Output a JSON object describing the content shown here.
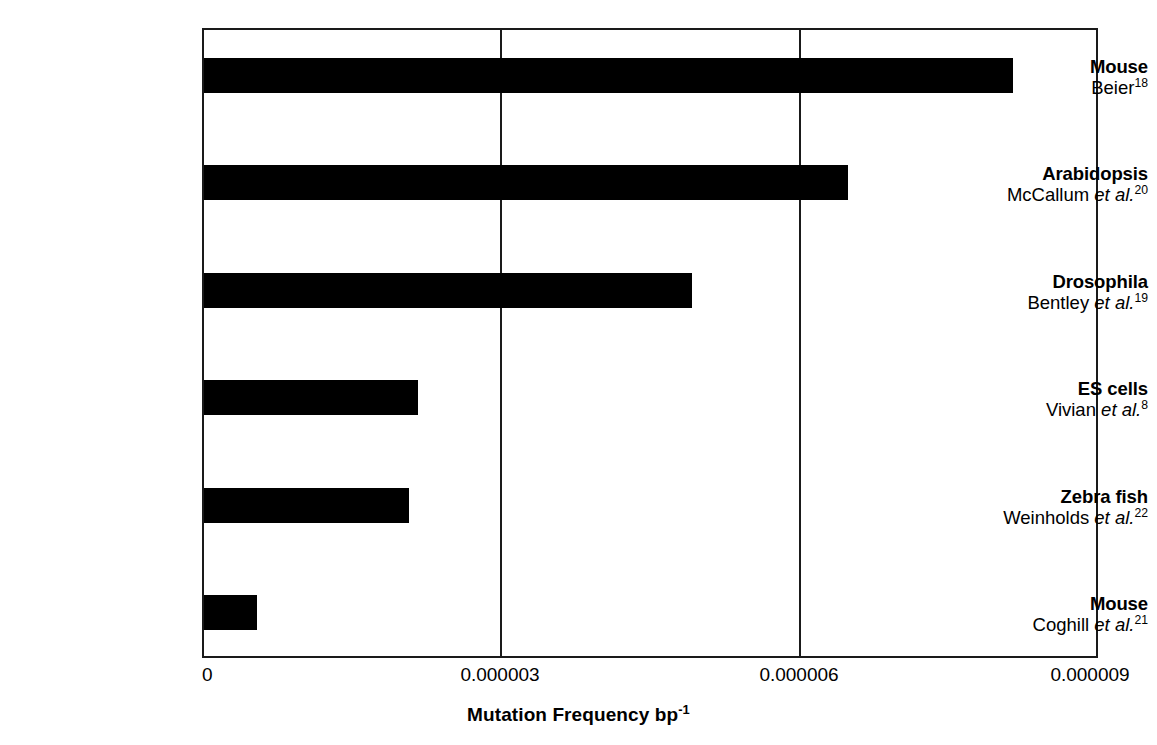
{
  "chart_data": {
    "type": "bar",
    "orientation": "horizontal",
    "title": "",
    "xlabel": "Mutation Frequency bp-1",
    "xlabel_rich": {
      "text": "Mutation Frequency bp",
      "superscript": "-1"
    },
    "ylabel": "",
    "xlim": [
      0,
      9e-06
    ],
    "xticks": [
      0,
      3e-06,
      6e-06,
      9e-06
    ],
    "xtick_labels": [
      "0",
      "0.000003",
      "0.000006",
      "0.000009"
    ],
    "grid": "vertical gridlines at 0.000003 and 0.000006",
    "legend": "none",
    "bar_color": "#000000",
    "categories": [
      "Mouse Beier18",
      "Arabidopsis McCallum et al.20",
      "Drosophila Bentley et al.19",
      "ES cells Vivian et al.8",
      "Zebra fish Weinholds et al.22",
      "Mouse Coghill et al.21"
    ],
    "values": [
      8.16e-06,
      6.5e-06,
      4.92e-06,
      2.16e-06,
      2.07e-06,
      5.3e-07
    ],
    "bars": [
      {
        "organism": "Mouse",
        "reference_author": "Beier",
        "reference_etal": "",
        "reference_superscript": "18",
        "value": 8.16e-06
      },
      {
        "organism": "Arabidopsis",
        "reference_author": "McCallum",
        "reference_etal": "et al.",
        "reference_superscript": "20",
        "value": 6.5e-06
      },
      {
        "organism": "Drosophila",
        "reference_author": "Bentley",
        "reference_etal": "et al.",
        "reference_superscript": "19",
        "value": 4.92e-06
      },
      {
        "organism": "ES cells",
        "reference_author": "Vivian",
        "reference_etal": "et al.",
        "reference_superscript": "8",
        "value": 2.16e-06
      },
      {
        "organism": "Zebra fish",
        "reference_author": "Weinholds",
        "reference_etal": "et al.",
        "reference_superscript": "22",
        "value": 2.07e-06
      },
      {
        "organism": "Mouse",
        "reference_author": "Coghill",
        "reference_etal": "et al.",
        "reference_superscript": "21",
        "value": 5.3e-07
      }
    ]
  }
}
